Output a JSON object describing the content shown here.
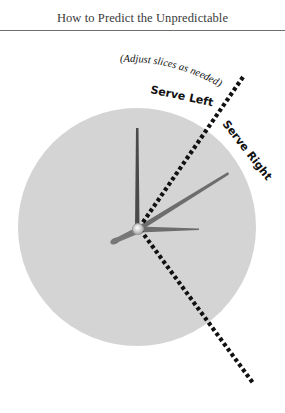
{
  "header": {
    "title": "How to Predict the Unpredictable"
  },
  "diagram": {
    "annotation": "(Adjust slices as needed)",
    "labels": {
      "serve_left": "Serve Left",
      "serve_right": "Serve Right"
    },
    "colors": {
      "clock_face": "#d4d4d4",
      "divider_line": "#111111",
      "hands": "#6d6d6d",
      "minute_hand": "#4a4a4a"
    }
  }
}
